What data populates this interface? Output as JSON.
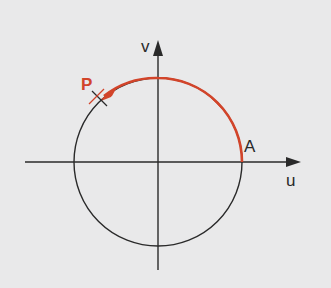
{
  "diagram": {
    "type": "unit-circle",
    "axes": {
      "horizontal_label": "u",
      "vertical_label": "v"
    },
    "points": {
      "start": {
        "label": "A",
        "angle_deg": 0
      },
      "end": {
        "label": "P",
        "angle_deg": 135
      }
    },
    "arc": {
      "from_deg": 0,
      "to_deg": 135,
      "direction": "counterclockwise",
      "tick_marks_deg": [
        45,
        135
      ]
    },
    "colors": {
      "background": "#e9e9ea",
      "line": "#2a2a2a",
      "accent": "#d2442a"
    }
  }
}
